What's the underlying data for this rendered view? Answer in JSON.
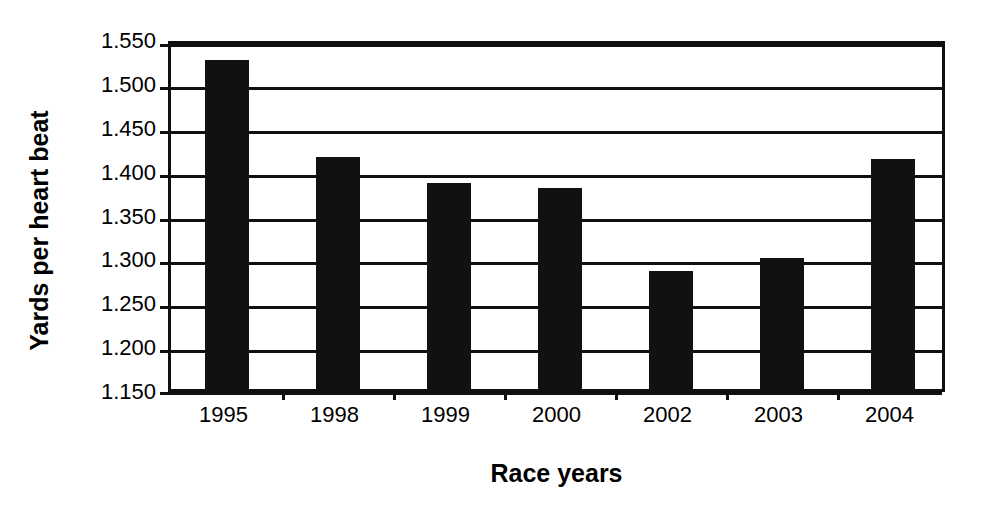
{
  "chart_data": {
    "type": "bar",
    "title": "",
    "xlabel": "Race years",
    "ylabel": "Yards per heart beat",
    "categories": [
      "1995",
      "1998",
      "1999",
      "2000",
      "2002",
      "2003",
      "2004"
    ],
    "values": [
      1.525,
      1.414,
      1.385,
      1.379,
      1.285,
      1.299,
      1.412
    ],
    "ylim": [
      1.15,
      1.55
    ],
    "ytick_labels": [
      "1.550",
      "1.500",
      "1.450",
      "1.400",
      "1.350",
      "1.300",
      "1.250",
      "1.200",
      "1.150"
    ],
    "ytick_values": [
      1.55,
      1.5,
      1.45,
      1.4,
      1.35,
      1.3,
      1.25,
      1.2,
      1.15
    ],
    "grid": true,
    "legend": "none",
    "bar_color": "#111111",
    "axis_color": "#101010",
    "background_color": "#ffffff"
  }
}
